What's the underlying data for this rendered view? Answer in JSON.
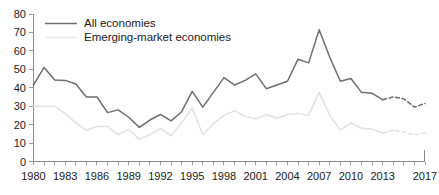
{
  "chart_data": {
    "type": "line",
    "title": "",
    "subtitle": "",
    "xlabel": "",
    "ylabel": "",
    "xlim": [
      1980,
      2017
    ],
    "ylim": [
      0,
      80
    ],
    "grid": false,
    "legend_position": "top-left",
    "y_ticks": [
      0,
      10,
      20,
      30,
      40,
      50,
      60,
      70,
      80
    ],
    "y_tick_labels": [
      "0",
      "10",
      "20",
      "30",
      "40",
      "50",
      "60",
      "70",
      "80"
    ],
    "x_ticks": [
      1980,
      1983,
      1986,
      1989,
      1992,
      1995,
      1998,
      2001,
      2004,
      2007,
      2010,
      2013,
      2017
    ],
    "x_tick_labels": [
      "1980",
      "1983",
      "1986",
      "1989",
      "1992",
      "1995",
      "1998",
      "2001",
      "2004",
      "2007",
      "2010",
      "2013",
      "2017"
    ],
    "x_minor_tick_interval": 1,
    "x": [
      1980,
      1981,
      1982,
      1983,
      1984,
      1985,
      1986,
      1987,
      1988,
      1989,
      1990,
      1991,
      1992,
      1993,
      1994,
      1995,
      1996,
      1997,
      1998,
      1999,
      2000,
      2001,
      2002,
      2003,
      2004,
      2005,
      2006,
      2007,
      2008,
      2009,
      2010,
      2011,
      2012,
      2013,
      2014,
      2015,
      2016,
      2017
    ],
    "forecast_start_year": 2013,
    "series": [
      {
        "name": "All economies",
        "color": "#6e6e6e",
        "style": "solid",
        "values": [
          41.5,
          51.0,
          44.2,
          44.0,
          42.0,
          35.0,
          35.0,
          26.5,
          28.0,
          24.0,
          18.5,
          22.5,
          25.5,
          22.0,
          27.0,
          38.0,
          29.5,
          37.5,
          45.5,
          41.5,
          44.0,
          47.5,
          39.5,
          41.5,
          43.5,
          55.5,
          53.5,
          71.5,
          56.5,
          43.5,
          45.0,
          37.5,
          37.0,
          33.5,
          35.0,
          34.0,
          29.5,
          31.5
        ]
      },
      {
        "name": "Emerging-market economies",
        "color": "#e2e2e2",
        "style": "solid",
        "values": [
          30.0,
          30.0,
          30.0,
          26.0,
          21.0,
          17.0,
          19.0,
          19.0,
          14.5,
          17.5,
          12.0,
          14.5,
          18.0,
          14.0,
          21.0,
          29.0,
          14.5,
          20.5,
          25.0,
          27.5,
          24.5,
          23.0,
          25.5,
          23.5,
          25.5,
          26.0,
          25.0,
          37.5,
          25.0,
          17.0,
          21.0,
          18.0,
          17.5,
          15.5,
          17.0,
          16.0,
          14.5,
          15.5
        ]
      }
    ]
  },
  "legend": {
    "items": [
      {
        "label": "All economies",
        "color": "#6e6e6e",
        "icon": "line-swatch-icon"
      },
      {
        "label": "Emerging-market economies",
        "color": "#e2e2e2",
        "icon": "line-swatch-icon"
      }
    ]
  }
}
